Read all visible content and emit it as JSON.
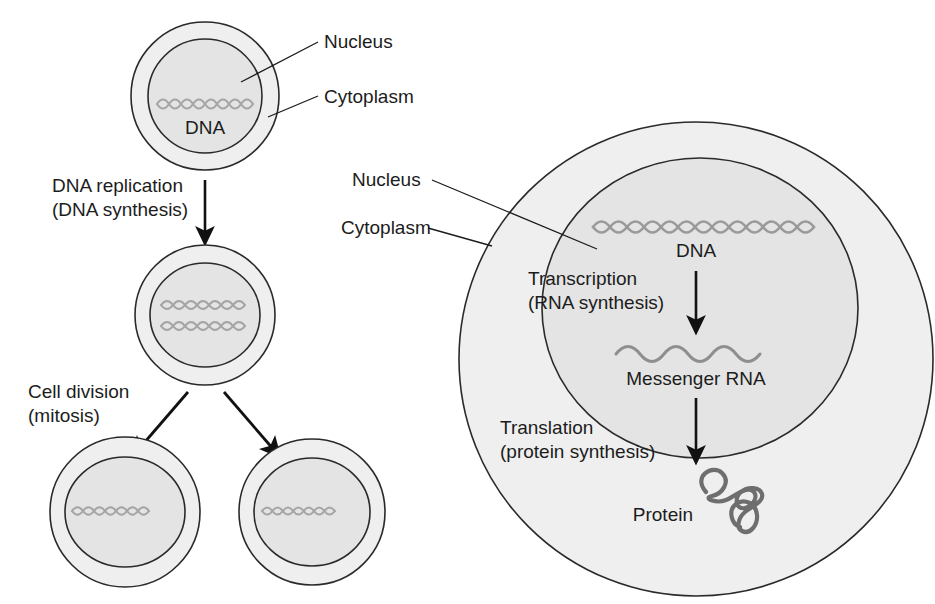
{
  "figure": {
    "background_color": "#ffffff",
    "cytoplasm_fill": "#efefef",
    "nucleus_fill": "#e4e4e4",
    "outline_color": "#2a2a2a",
    "dna_color": "#9a9a9a",
    "rna_color": "#8e8e8e",
    "protein_color": "#6e6e6e",
    "text_color": "#1c1c1c"
  },
  "left_panel": {
    "parent_cell": {
      "label_nucleus": "Nucleus",
      "label_cytoplasm": "Cytoplasm",
      "label_dna": "DNA",
      "dna_strands": 1
    },
    "process_replication": {
      "line1": "DNA replication",
      "line2": "(DNA synthesis)"
    },
    "replicated_cell": {
      "dna_strands": 2
    },
    "process_division": {
      "line1": "Cell division",
      "line2": "(mitosis)"
    },
    "daughter_cells": [
      {
        "name": "daughter-cell-left",
        "dna_strands": 1
      },
      {
        "name": "daughter-cell-right",
        "dna_strands": 1
      }
    ]
  },
  "right_panel": {
    "label_nucleus": "Nucleus",
    "label_cytoplasm": "Cytoplasm",
    "label_dna": "DNA",
    "process_transcription": {
      "line1": "Transcription",
      "line2": "(RNA synthesis)"
    },
    "label_mrna": "Messenger RNA",
    "process_translation": {
      "line1": "Translation",
      "line2": "(protein synthesis)"
    },
    "label_protein": "Protein"
  }
}
